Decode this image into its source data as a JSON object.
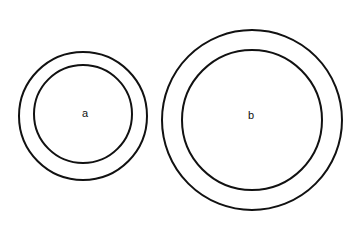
{
  "figure": {
    "background_color": "#ffffff",
    "stroke_color": "#111111",
    "label_color": "#111111",
    "canvas": {
      "width": 363,
      "height": 234
    },
    "shapes": [
      {
        "name": "circle-a-outer",
        "kind": "circle",
        "cx": 83,
        "cy": 116,
        "r": 64,
        "stroke_width": 2,
        "fill": "none"
      },
      {
        "name": "circle-a-inner",
        "kind": "circle",
        "cx": 83,
        "cy": 114,
        "r": 49,
        "stroke_width": 2,
        "fill": "none"
      },
      {
        "name": "circle-b-outer",
        "kind": "circle",
        "cx": 252,
        "cy": 120,
        "r": 90,
        "stroke_width": 2,
        "fill": "none"
      },
      {
        "name": "circle-b-inner",
        "kind": "circle",
        "cx": 252,
        "cy": 120,
        "r": 70,
        "stroke_width": 2,
        "fill": "none"
      }
    ],
    "labels": [
      {
        "name": "label-a",
        "text": "a",
        "x": 85,
        "y": 114,
        "font_size": 11
      },
      {
        "name": "label-b",
        "text": "b",
        "x": 251,
        "y": 116,
        "font_size": 11
      }
    ]
  }
}
